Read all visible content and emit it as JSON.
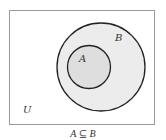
{
  "diagram": {
    "type": "venn",
    "universe_label": "U",
    "sets": [
      {
        "label": "B",
        "contains": [
          "A"
        ],
        "fill": "#ececec"
      },
      {
        "label": "A",
        "fill": "#dedede"
      }
    ],
    "caption": "A ⊆ B",
    "colors": {
      "stroke": "#222222",
      "frame": "#9a9a9a",
      "text": "#333333",
      "background": "#ffffff"
    }
  }
}
